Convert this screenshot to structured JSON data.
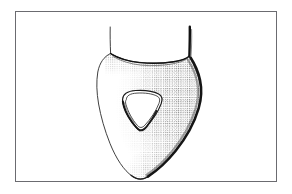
{
  "figure": {
    "kind": "line-drawing",
    "medium": "pen-and-ink stipple illustration",
    "subject_name": "teardrop-shaped body with central triangular aperture",
    "background_color": "#ffffff",
    "ink_color": "#111111",
    "frame": {
      "name": "figure-border",
      "stroke_color": "#6b6b70",
      "stroke_width": 1,
      "x": 15,
      "y": 11,
      "width": 262,
      "height": 171
    },
    "canvas": {
      "width": 292,
      "height": 194
    },
    "elements": {
      "left_stem": {
        "label": "left thin stem line",
        "stroke_color": "#2a2a2a",
        "stroke_width": 0.9,
        "x_top": 110,
        "y_top": 27,
        "x_bottom": 111,
        "y_bottom": 54
      },
      "right_stem": {
        "label": "right thick stem line",
        "stroke_color": "#111111",
        "stroke_width": 2.4,
        "x_top": 190,
        "y_top": 27,
        "x_bottom": 189,
        "y_bottom": 55
      },
      "body_outline": {
        "label": "main teardrop outline",
        "stroke_color": "#2a2a2a",
        "stroke_width": 0.9,
        "bounds": {
          "left": 97,
          "top": 52,
          "right": 201,
          "bottom": 179
        },
        "tip_x": 146,
        "tip_y": 178
      },
      "top_rim": {
        "label": "concave top rim with dark stipple",
        "stroke_color": "#111111",
        "stroke_width": 1.4,
        "from_x": 110,
        "from_y": 53,
        "to_x": 190,
        "to_y": 57,
        "dip_y": 62
      },
      "shaded_edge": {
        "label": "stippled shading along right and lower-right margin",
        "dot_color": "#1a1a1a",
        "dot_count": 2200,
        "density": "dense at margin, fading inward"
      },
      "aperture": {
        "label": "rounded triangular aperture",
        "stroke_color": "#1b1b1b",
        "stroke_width": 1.2,
        "bounds": {
          "left": 122,
          "top": 92,
          "right": 161,
          "bottom": 129
        },
        "has_inner_rim": true,
        "inner_rim_side": "left and bottom"
      }
    },
    "labels": [],
    "caption": ""
  }
}
